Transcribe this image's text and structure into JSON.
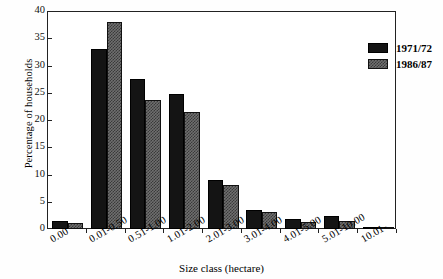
{
  "chart_data": {
    "type": "bar",
    "title": "",
    "xlabel": "Size class (hectare)",
    "ylabel": "Percentage of households",
    "ylim": [
      0,
      40
    ],
    "yticks": [
      0,
      5,
      10,
      15,
      20,
      25,
      30,
      35,
      40
    ],
    "grid": false,
    "legend_position": "top-right",
    "categories": [
      "0.00",
      "0.01-0.50",
      "0.51-1.00",
      "1.01-2.00",
      "2.01-3.00",
      "3.01-4.00",
      "4.01-5.00",
      "5.01-10.00",
      "10.01-"
    ],
    "series": [
      {
        "name": "1971/72",
        "color": "#141414",
        "values": [
          1.4,
          33.0,
          27.5,
          24.7,
          9.0,
          3.5,
          1.9,
          2.3,
          0.3
        ]
      },
      {
        "name": "1986/87",
        "color": "#6f6f6f",
        "values": [
          1.1,
          38.0,
          23.7,
          21.5,
          8.0,
          3.2,
          1.2,
          1.4,
          0.3
        ]
      }
    ]
  },
  "axes": {
    "y_title": "Percentage of households",
    "x_title": "Size class (hectare)",
    "y_tick_labels": [
      "40",
      "35",
      "30",
      "25",
      "20",
      "15",
      "10",
      "5",
      "0"
    ]
  },
  "legend": {
    "entries": [
      {
        "label": "1971/72"
      },
      {
        "label": "1986/87"
      }
    ]
  }
}
